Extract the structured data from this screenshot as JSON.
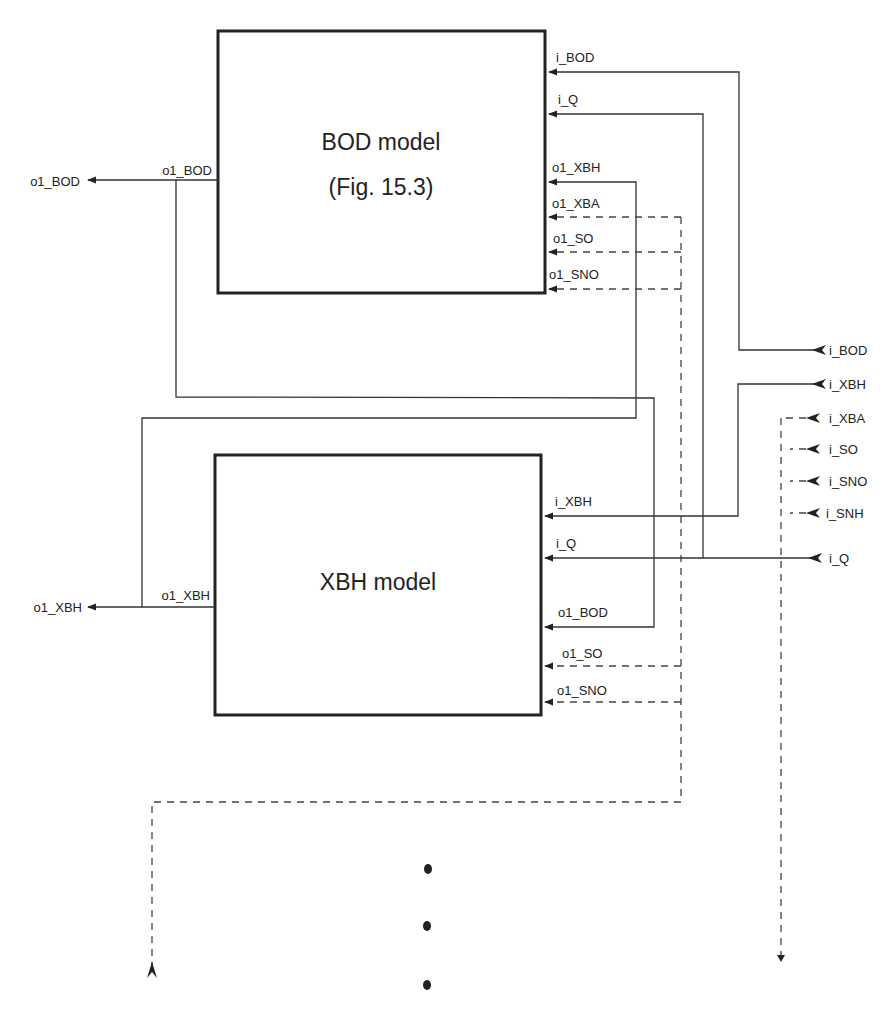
{
  "diagram": {
    "type": "block-diagram",
    "blocks": [
      {
        "id": "bod",
        "title": "BOD model",
        "subtitle": "(Fig. 15.3)",
        "output_port": "o1_BOD",
        "input_ports": [
          "i_BOD",
          "i_Q",
          "o1_XBH",
          "o1_XBA",
          "o1_SO",
          "o1_SNO"
        ]
      },
      {
        "id": "xbh",
        "title": "XBH model",
        "output_port": "o1_XBH",
        "input_ports": [
          "i_XBH",
          "i_Q",
          "o1_BOD",
          "o1_SO",
          "o1_SNO"
        ]
      }
    ],
    "external_outputs": [
      "o1_BOD",
      "o1_XBH"
    ],
    "external_inputs": [
      "i_BOD",
      "i_XBH",
      "i_XBA",
      "i_SO",
      "i_SNO",
      "i_SNH",
      "i_Q"
    ],
    "continuation": "ellipsis-vertical",
    "line_styles": {
      "solid": "signal connections (i_BOD, i_Q, i_XBH, o1_BOD, o1_XBH)",
      "dashed": "signal connections (i_XBA, i_SO, i_SNO, i_SNH and continuation to further models)"
    }
  },
  "colors": {
    "line": "#333333",
    "text": "#222222",
    "background": "#ffffff"
  }
}
